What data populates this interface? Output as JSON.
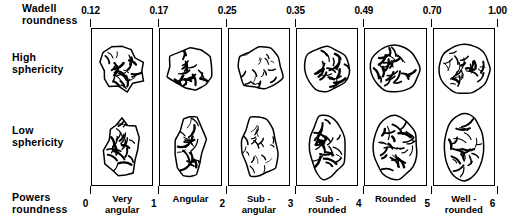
{
  "figure": {
    "top_axis_label": "Wadell\nroundness",
    "row_high_label": "High\n sphericity",
    "row_low_label": "Low\n sphericity",
    "bottom_axis_label": "Powers\n roundness",
    "ink_color": "#000000",
    "background_color": "#ffffff"
  },
  "chart_data": {
    "type": "table",
    "xlabel": "Powers roundness",
    "ylabel": "Sphericity",
    "columns": [
      "Very\nangular",
      "Angular",
      "Sub -\nangular",
      "Sub -\nrounded",
      "Rounded",
      "Well -\nrounded"
    ],
    "rows": [
      "High sphericity",
      "Low sphericity"
    ],
    "wadell_roundness_boundaries": [
      "0.12",
      "0.17",
      "0.25",
      "0.35",
      "0.49",
      "0.70",
      "1.00"
    ],
    "powers_roundness_boundaries": [
      "0",
      "1",
      "2",
      "3",
      "4",
      "5",
      "6"
    ],
    "cells": [
      {
        "class_name": "Very\nangular",
        "powers_range": "0-1",
        "wadell_range": "0.12-0.17",
        "high_sphericity_grain": "very-angular-equant",
        "low_sphericity_grain": "very-angular-elongate"
      },
      {
        "class_name": "Angular",
        "powers_range": "1-2",
        "wadell_range": "0.17-0.25",
        "high_sphericity_grain": "angular-equant",
        "low_sphericity_grain": "angular-elongate"
      },
      {
        "class_name": "Sub -\nangular",
        "powers_range": "2-3",
        "wadell_range": "0.25-0.35",
        "high_sphericity_grain": "subangular-equant",
        "low_sphericity_grain": "subangular-elongate"
      },
      {
        "class_name": "Sub -\nrounded",
        "powers_range": "3-4",
        "wadell_range": "0.35-0.49",
        "high_sphericity_grain": "subrounded-equant",
        "low_sphericity_grain": "subrounded-elongate"
      },
      {
        "class_name": "Rounded",
        "powers_range": "4-5",
        "wadell_range": "0.49-0.70",
        "high_sphericity_grain": "rounded-equant",
        "low_sphericity_grain": "rounded-elongate"
      },
      {
        "class_name": "Well -\nrounded",
        "powers_range": "5-6",
        "wadell_range": "0.70-1.00",
        "high_sphericity_grain": "well-rounded-circular",
        "low_sphericity_grain": "well-rounded-oval"
      }
    ],
    "grid": false,
    "legend": "none"
  }
}
